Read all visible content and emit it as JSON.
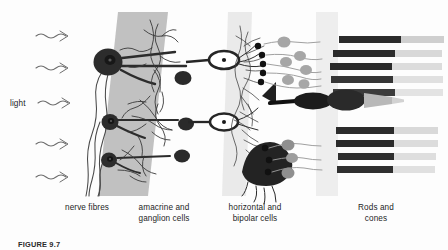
{
  "figure": {
    "caption": "FIGURE 9.7",
    "light_label": "light"
  },
  "labels": {
    "nerve_fibres": "nerve fibres",
    "amacrine_ganglion": "amacrine and\nganglion cells",
    "horizontal_bipolar": "horizontal and\nbipolar cells",
    "rods_cones": "Rods and\ncones"
  },
  "colors": {
    "background": "#fdfdfd",
    "ink": "#1a1a1a",
    "band_ganglion": "#b9b9b9",
    "band_bipolar": "#e6e6e6",
    "band_receptor": "#ececec",
    "cell_dark": "#2b2b2b",
    "nucleus_gray": "#9a9a9a",
    "rod_outer": "#d6d6d6",
    "rod_inner": "#2c2c2c",
    "fibre": "#555555"
  },
  "structures": {
    "light_arrows": 5,
    "ganglion_cells": 3,
    "bipolar_cells": 2,
    "amacrine_cells": 3,
    "horizontal_cells": 2,
    "rods_upper": 5,
    "rods_lower": 4,
    "cones": 1,
    "photoreceptor_nuclei": 9
  }
}
